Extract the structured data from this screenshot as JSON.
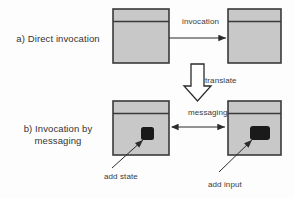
{
  "figure": {
    "background_color": "#fdfdfd",
    "box_fill_color": "#c8c8c8",
    "box_border_color": "#3a3a3a",
    "shape_color": "#1a1a1a",
    "line_color": "#2b2b2b"
  },
  "rows": {
    "a": {
      "label": "a) Direct invocation",
      "edge_label": "invocation",
      "arrow_type": "single-headed",
      "boxes": [
        {
          "name": "caller-component",
          "has_header_strip": true,
          "inner_shape": null
        },
        {
          "name": "callee-component",
          "has_header_strip": true,
          "inner_shape": null
        }
      ]
    },
    "b": {
      "label_line1": "b) Invocation by",
      "label_line2": "messaging",
      "edge_label": "messaging",
      "arrow_type": "double-headed",
      "boxes": [
        {
          "name": "sender-component",
          "has_header_strip": true,
          "inner_shape": "small-square"
        },
        {
          "name": "receiver-component",
          "has_header_strip": true,
          "inner_shape": "wide-rectangle"
        }
      ]
    }
  },
  "transform": {
    "label": "translate",
    "arrow_type": "hollow-block-down"
  },
  "callouts": [
    {
      "name": "add-state",
      "label": "add state",
      "points_to": "sender-component"
    },
    {
      "name": "add-input",
      "label": "add input",
      "points_to": "receiver-component"
    }
  ]
}
